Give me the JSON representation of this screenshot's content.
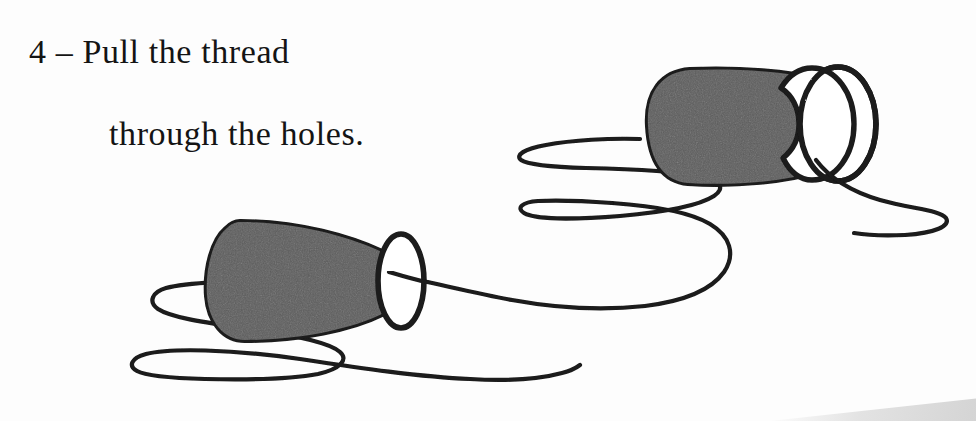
{
  "page": {
    "title": "Pull the thread through the holes",
    "width": 976,
    "height": 421,
    "background_color": "#fdfdfd"
  },
  "caption": {
    "step_number": "4",
    "line_1": "4 – Pull the thread",
    "line_2": "through the holes.",
    "full_text": "4 – Pull the thread through the holes.",
    "text_color": "#141414",
    "font_size_px": 34
  },
  "illustration": {
    "description": "Two paper cups connected by a long loose thread, drawn as a hand-inked line illustration; a string telephone craft step.",
    "line_color": "#1a1a1a",
    "cup_fill_color": "#5c5c5c",
    "cup_hole_color": "#ffffff",
    "thread_stroke_width": 4.2,
    "objects": [
      {
        "name": "cup-left",
        "label": "Left paper cup",
        "fill": "#5c5c5c",
        "outline": "#1a1a1a",
        "hole_center": [
          401,
          279
        ],
        "hole_radius": [
          23,
          47
        ],
        "body_bounds": [
          205,
          220,
          425,
          340
        ]
      },
      {
        "name": "cup-right",
        "label": "Right paper cup",
        "fill": "#5c5c5c",
        "outline": "#1a1a1a",
        "hole_center": [
          838,
          124
        ],
        "hole_radius": [
          38,
          57
        ],
        "body_bounds": [
          645,
          65,
          878,
          185
        ]
      },
      {
        "name": "thread",
        "label": "Thread running between the two cups",
        "stroke": "#1a1a1a"
      }
    ]
  },
  "artifacts": {
    "page_edge_shadow": {
      "label": "Scanned page corner shadow",
      "color": "#dedede",
      "position": "bottom-right"
    }
  }
}
